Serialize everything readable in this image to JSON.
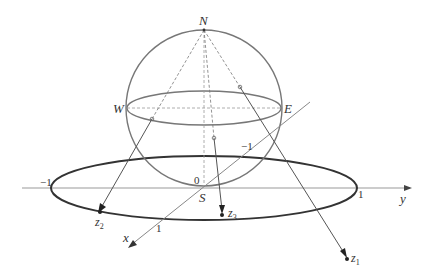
{
  "diagram": {
    "labels": {
      "north": "N",
      "south": "S",
      "west": "W",
      "east": "E",
      "origin": "0",
      "x_axis": "x",
      "y_axis": "y",
      "y_neg_one": "−1",
      "y_pos_one": "1",
      "x_pos_one": "1",
      "x_neg_one": "−1",
      "z1": "z",
      "z1_sub": "1",
      "z2": "z",
      "z2_sub": "2",
      "z3": "z",
      "z3_sub": "3"
    },
    "colors": {
      "sphere": "#777777",
      "unit_circle": "#333333",
      "axes": "#888888",
      "rays": "#555555",
      "text": "#333333"
    }
  }
}
